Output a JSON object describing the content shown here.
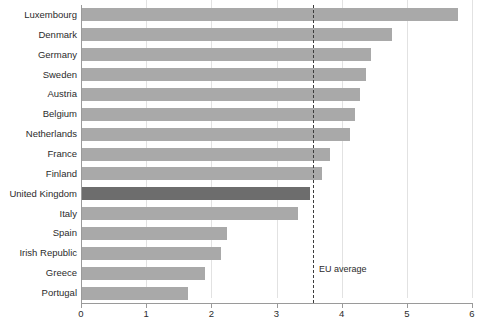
{
  "chart_data": {
    "type": "bar",
    "orientation": "horizontal",
    "title": "",
    "subtitle": "",
    "xlabel": "",
    "ylabel": "",
    "xlim": [
      0,
      6
    ],
    "xticks": [
      0,
      1,
      2,
      3,
      4,
      5,
      6
    ],
    "xtick_labels": [
      "0",
      "1",
      "2",
      "3",
      "4",
      "5",
      "6"
    ],
    "grid": "vertical",
    "legend": "none",
    "categories": [
      "Luxembourg",
      "Denmark",
      "Germany",
      "Sweden",
      "Austria",
      "Belgium",
      "Netherlands",
      "France",
      "Finland",
      "United Kingdom",
      "Italy",
      "Spain",
      "Irish Republic",
      "Greece",
      "Portugal"
    ],
    "values": [
      5.78,
      4.77,
      4.45,
      4.37,
      4.28,
      4.2,
      4.13,
      3.82,
      3.7,
      3.51,
      3.33,
      2.24,
      2.15,
      1.9,
      1.64
    ],
    "highlight_category": "United Kingdom",
    "annotations": [
      {
        "name": "eu-average",
        "label": "EU average",
        "value": 3.56,
        "style": "dashed-vertical-line"
      }
    ],
    "colors": {
      "bar": "#a9a9a9",
      "bar_highlight": "#6d6d6d",
      "gridline": "#e2e2e2",
      "axis": "#9a9a9a",
      "annotation_line": "#3c3c3c",
      "text": "#2b2b2b",
      "background": "#ffffff"
    }
  }
}
